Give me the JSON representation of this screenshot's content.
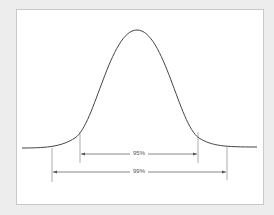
{
  "diagram": {
    "type": "normal-distribution",
    "curve_color": "#444444",
    "line_color": "#666666",
    "intervals": [
      {
        "label": "95%"
      },
      {
        "label": "99%"
      }
    ]
  }
}
